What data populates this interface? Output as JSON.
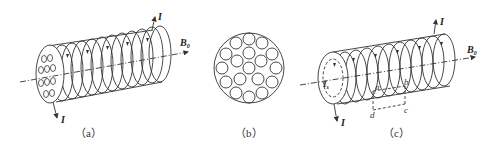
{
  "figures": [
    {
      "id": "a",
      "caption": "（a）",
      "labels": {
        "current_top": "I",
        "current_bottom": "I",
        "field": "B",
        "field_sub": "0"
      },
      "description": "Solenoid-like cylinder with multiple windings; end face shows array of small circles (molecular currents)"
    },
    {
      "id": "b",
      "caption": "（b）",
      "description": "Cross-section: large circle containing 19 small circles each with circulating current arrows"
    },
    {
      "id": "c",
      "caption": "（c）",
      "labels": {
        "current_top": "I",
        "current_bottom": "I",
        "field": "B",
        "field_sub": "0",
        "surface_current": "I",
        "surface_current_sub": "s",
        "loop_points": [
          "a",
          "b",
          "c",
          "d"
        ]
      },
      "description": "Cylinder with windings and surface magnetization current Is; rectangular loop abcd drawn across surface"
    }
  ],
  "colors": {
    "line": "#333333",
    "background": "#ffffff"
  }
}
